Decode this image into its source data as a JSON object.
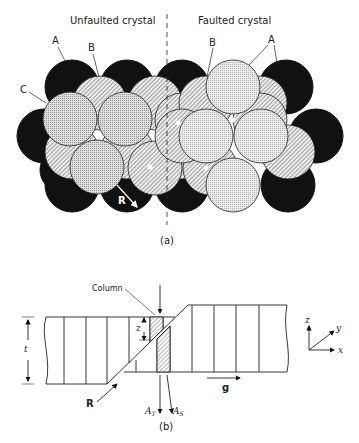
{
  "figure_a": {
    "title_left": "Unfaulted crystal",
    "title_right": "Faulted crystal",
    "labels": {
      "A_left": "A",
      "B_left": "B",
      "C_left": "C",
      "B_right": "B",
      "A_right": "A",
      "R": "R"
    },
    "caption": "(a)",
    "legend_layers": [
      {
        "layer": "A",
        "fill": "black"
      },
      {
        "layer": "B",
        "fill": "diagonal-hatch"
      },
      {
        "layer": "C",
        "fill": "stipple-grey"
      }
    ]
  },
  "figure_b": {
    "column_label": "Column",
    "z_label": "z",
    "t_label": "t",
    "R_label": "R",
    "g_label": "g",
    "AT_label": "A",
    "AT_sub": "T",
    "AS_label": "A",
    "AS_sub": "S",
    "caption": "(b)",
    "axes": {
      "z": "z",
      "y": "y",
      "x": "x"
    }
  },
  "colors": {
    "ink": "#111111",
    "stipple": "#d9d9d9",
    "hatch_bg": "#e6e6e6",
    "paper": "#ffffff"
  }
}
